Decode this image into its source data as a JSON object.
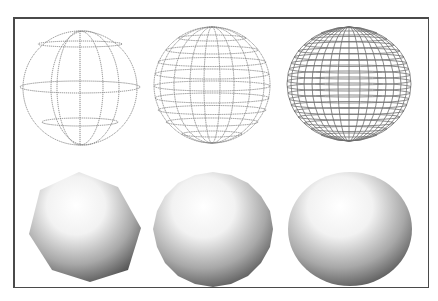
{
  "figure": {
    "rows": [
      {
        "name": "wireframe",
        "items": [
          {
            "label": "low",
            "meridians": 4,
            "parallels": 4
          },
          {
            "label": "medium",
            "meridians": 10,
            "parallels": 10
          },
          {
            "label": "high",
            "meridians": 20,
            "parallels": 20
          }
        ]
      },
      {
        "name": "shaded",
        "items": [
          {
            "label": "low",
            "sides": 7
          },
          {
            "label": "medium",
            "sides": 20
          },
          {
            "label": "high",
            "sides": 64
          }
        ]
      }
    ],
    "colors": {
      "frame": "#4a4a4a",
      "wire": "#7a7a7a",
      "shade_light": "#ffffff",
      "shade_dark": "#4a4a4a"
    }
  }
}
